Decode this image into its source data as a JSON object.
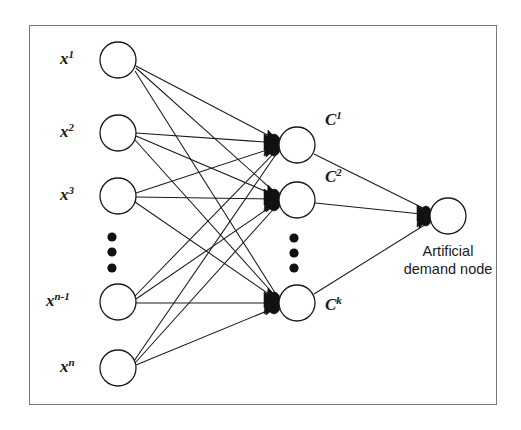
{
  "diagram": {
    "type": "neural-network",
    "title": "",
    "frame": {
      "x": 29,
      "y": 25,
      "width": 468,
      "height": 380,
      "border_color": "#7a7a7a"
    },
    "colors": {
      "stroke": "#1a1a1a",
      "node_fill": "#ffffff",
      "arrowhead": "#111111",
      "frame": "#7a7a7a"
    },
    "input_layer": {
      "name": "input-layer",
      "node_radius": 18,
      "nodes": [
        {
          "id": "x1",
          "label_base": "x",
          "label_sup": "1",
          "cx": 118,
          "cy": 60,
          "label_x": 60,
          "label_y": 52
        },
        {
          "id": "x2",
          "label_base": "x",
          "label_sup": "2",
          "cx": 118,
          "cy": 133,
          "label_x": 60,
          "label_y": 125
        },
        {
          "id": "x3",
          "label_base": "x",
          "label_sup": "3",
          "cx": 118,
          "cy": 196,
          "label_x": 60,
          "label_y": 188
        },
        {
          "id": "xn1",
          "label_base": "x",
          "label_sup": "n-1",
          "cx": 118,
          "cy": 302,
          "label_x": 47,
          "label_y": 294
        },
        {
          "id": "xn",
          "label_base": "x",
          "label_sup": "n",
          "cx": 118,
          "cy": 368,
          "label_x": 60,
          "label_y": 360
        }
      ],
      "ellipsis": {
        "cx": 112,
        "dots_y": [
          237,
          252,
          268
        ],
        "radius": 4.5
      }
    },
    "hidden_layer": {
      "name": "cluster-layer",
      "node_radius": 18,
      "nodes": [
        {
          "id": "c1",
          "label_base": "C",
          "label_sup": "1",
          "cx": 297,
          "cy": 145,
          "label_x": 325,
          "label_y": 122
        },
        {
          "id": "c2",
          "label_base": "C",
          "label_sup": "2",
          "cx": 297,
          "cy": 200,
          "label_x": 325,
          "label_y": 178
        },
        {
          "id": "ck",
          "label_base": "C",
          "label_sup": "k",
          "cx": 297,
          "cy": 303,
          "label_x": 325,
          "label_y": 300
        }
      ],
      "ellipsis": {
        "cx": 294,
        "dots_y": [
          238,
          253,
          268
        ],
        "radius": 4.5
      }
    },
    "output_layer": {
      "name": "demand-layer",
      "node_radius": 18,
      "node": {
        "id": "demand",
        "cx": 448,
        "cy": 216
      },
      "caption_line1": "Artificial",
      "caption_line2": "demand node",
      "caption_x": 448,
      "caption_y": 240
    },
    "edges_note": "fully connected input-to-cluster, cluster-to-demand"
  }
}
